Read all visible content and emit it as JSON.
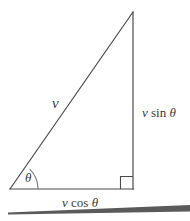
{
  "figure": {
    "background_color": "#ffffff",
    "stroke_color": "#4a4a4a",
    "ground_color": "#5a5a5a",
    "text_color": "#3a3a3a"
  },
  "labels": {
    "hypotenuse": {
      "symbol": "v",
      "full_text": "v"
    },
    "vertical_leg": {
      "symbol": "v",
      "function": "sin",
      "angle": "θ",
      "full_text": "v sin θ"
    },
    "horizontal_leg": {
      "symbol": "v",
      "function": "cos",
      "angle": "θ",
      "full_text": "v cos θ"
    },
    "angle": {
      "symbol": "θ",
      "full_text": "θ"
    }
  },
  "geometry": {
    "origin_vertex": {
      "x": 10,
      "y": 189
    },
    "apex_vertex": {
      "x": 133,
      "y": 12
    },
    "corner_vertex": {
      "x": 133,
      "y": 189
    },
    "right_angle_marker_size": 13,
    "angle_arc_radius": 28,
    "ground_left_y": 212,
    "ground_right_y": 206,
    "ground_thickness_left": 2,
    "ground_thickness_right": 6
  }
}
